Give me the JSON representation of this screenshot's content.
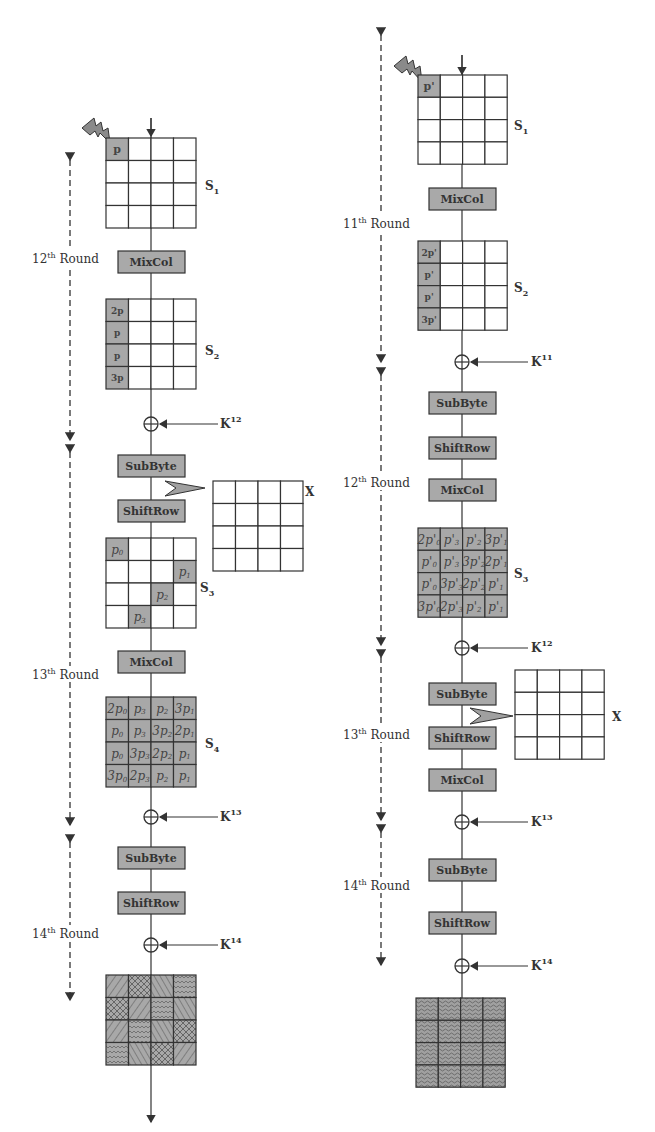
{
  "left": {
    "fault_cell": "p",
    "rounds": [
      {
        "label": "12",
        "sup": "th",
        "word": "Round"
      },
      {
        "label": "13",
        "sup": "th",
        "word": "Round"
      },
      {
        "label": "14",
        "sup": "th",
        "word": "Round"
      }
    ],
    "states": {
      "s1": {
        "name": "S",
        "sub": "1"
      },
      "s2": {
        "name": "S",
        "sub": "2",
        "col0": [
          "2p",
          "p",
          "p",
          "3p"
        ]
      },
      "s3": {
        "name": "S",
        "sub": "3",
        "diag": [
          "p0",
          "p1",
          "p2",
          "p3"
        ]
      },
      "s4": {
        "name": "S",
        "sub": "4",
        "rows": [
          [
            "2p0",
            "p3",
            "p2",
            "3p1"
          ],
          [
            "p0",
            "p3",
            "3p2",
            "2p1"
          ],
          [
            "p0",
            "3p3",
            "2p2",
            "p1"
          ],
          [
            "3p0",
            "2p3",
            "p2",
            "p1"
          ]
        ]
      }
    },
    "ops": {
      "mixcol1": "MixCol",
      "subbyte1": "SubByte",
      "shiftrow1": "ShiftRow",
      "mixcol2": "MixCol",
      "subbyte2": "SubByte",
      "shiftrow2": "ShiftRow"
    },
    "keys": [
      {
        "name": "K",
        "sup": "12"
      },
      {
        "name": "K",
        "sup": "13"
      },
      {
        "name": "K",
        "sup": "14"
      }
    ],
    "x_label": "X"
  },
  "right": {
    "fault_cell": "p'",
    "rounds": [
      {
        "label": "11",
        "sup": "th",
        "word": "Round"
      },
      {
        "label": "12",
        "sup": "th",
        "word": "Round"
      },
      {
        "label": "13",
        "sup": "th",
        "word": "Round"
      },
      {
        "label": "14",
        "sup": "th",
        "word": "Round"
      }
    ],
    "states": {
      "s1": {
        "name": "S",
        "sub": "1"
      },
      "s2": {
        "name": "S",
        "sub": "2",
        "col0": [
          "2p'",
          "p'",
          "p'",
          "3p'"
        ]
      },
      "s3": {
        "name": "S",
        "sub": "3",
        "rows": [
          [
            "2p'0",
            "p'3",
            "p'2",
            "3p'1"
          ],
          [
            "p'0",
            "p'3",
            "3p'2",
            "2p'1"
          ],
          [
            "p'0",
            "3p'3",
            "2p'2",
            "p'1"
          ],
          [
            "3p'0",
            "2p'3",
            "p'2",
            "p'1"
          ]
        ]
      }
    },
    "ops": {
      "mixcol1": "MixCol",
      "subbyte1": "SubByte",
      "shiftrow1": "ShiftRow",
      "mixcol2": "MixCol",
      "subbyte2": "SubByte",
      "shiftrow2": "ShiftRow",
      "mixcol3": "MixCol",
      "subbyte3": "SubByte",
      "shiftrow3": "ShiftRow"
    },
    "keys": [
      {
        "name": "K",
        "sup": "11"
      },
      {
        "name": "K",
        "sup": "12"
      },
      {
        "name": "K",
        "sup": "13"
      },
      {
        "name": "K",
        "sup": "14"
      }
    ],
    "x_label": "X"
  }
}
